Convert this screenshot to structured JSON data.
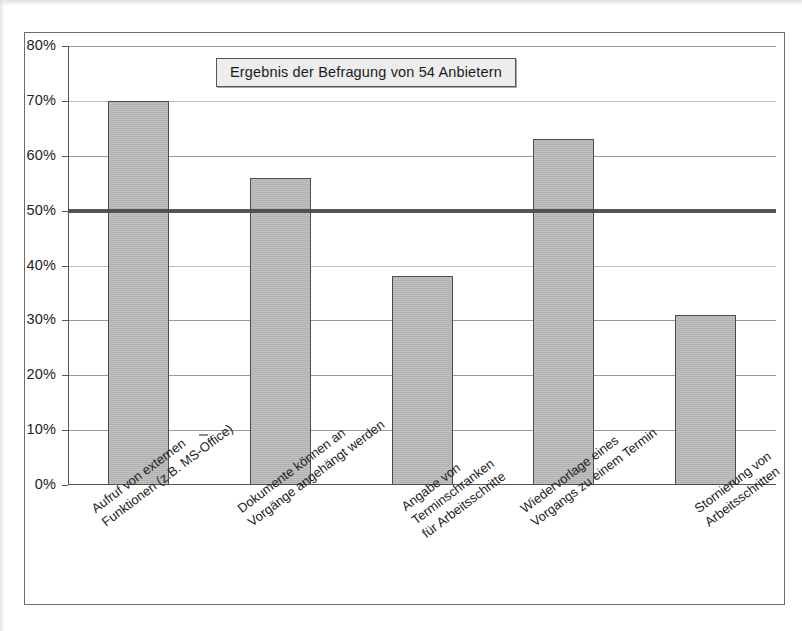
{
  "chart_data": {
    "type": "bar",
    "title": "Ergebnis der Befragung von 54 Anbietern",
    "xlabel": "",
    "ylabel": "",
    "ylim": [
      0,
      80
    ],
    "grid": true,
    "legend": "none",
    "orientation": "vertical",
    "value_suffix": "%",
    "categories": [
      "Aufruf von externen Funktionen (z.B. MS-Office)",
      "Dokumente können an Vorgänge angehängt werden",
      "Angabe von Terminschranken für Arbeitsschritte",
      "Wiedervorlage eines Vorgangs zu einem Termin",
      "Stornierung von Arbeitsschritten"
    ],
    "category_lines": [
      [
        "Aufruf von externen",
        "Funktionen (z.B. MS-Office)"
      ],
      [
        "Dokumente können an",
        "Vorgänge angehängt werden"
      ],
      [
        "Angabe von",
        "Terminschranken",
        "für Arbeitsschritte"
      ],
      [
        "Wiedervorlage eines",
        "Vorgangs zu einem Termin"
      ],
      [
        "Stornierung von",
        "Arbeitsschritten"
      ]
    ],
    "values": [
      70,
      56,
      38,
      63,
      31
    ],
    "ytick_labels": [
      "80%",
      "70%",
      "60%",
      "50%",
      "40%",
      "30%",
      "20%",
      "10%",
      "0%"
    ],
    "ytick_values": [
      80,
      70,
      60,
      50,
      40,
      30,
      20,
      10,
      0
    ],
    "threshold": {
      "value": 50,
      "label": "",
      "color": "#4a4a4a"
    },
    "colors": {
      "bar_fill": "#b9b9b9",
      "bar_border": "#4d4d4d",
      "gridline": "#9a9a9a",
      "axis": "#545454",
      "threshold": "#4a4a4a",
      "title_box_bg": "#ededed",
      "title_box_border": "#555555",
      "text": "#232323",
      "frame_border": "#6b6b6b",
      "background": "#ffffff"
    }
  }
}
